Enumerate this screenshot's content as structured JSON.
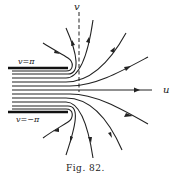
{
  "figure": {
    "caption": "Fig. 82.",
    "axes": {
      "horizontal_label": "u",
      "vertical_label": "v"
    },
    "walls": {
      "top_label": "v = π",
      "bottom_label": "v = −π"
    }
  },
  "labels": {
    "u": "u",
    "v": "v",
    "top_wall": "v=π",
    "bottom_wall": "v=−π",
    "caption": "Fig. 82."
  }
}
